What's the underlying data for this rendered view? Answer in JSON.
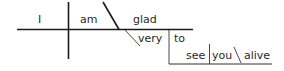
{
  "diagram": {
    "type": "sentence-diagram",
    "sentence": "I am glad to see you alive",
    "words": {
      "subject": "I",
      "verb": "am",
      "predicate_adjective": "glad",
      "adverb_modifier": "very",
      "infinitive_marker": "to",
      "infinitive_verb": "see",
      "infinitive_object": "you",
      "object_complement": "alive"
    },
    "colors": {
      "line": "#1a1a1a",
      "text": "#2a2a2a",
      "background": "#ffffff"
    }
  }
}
